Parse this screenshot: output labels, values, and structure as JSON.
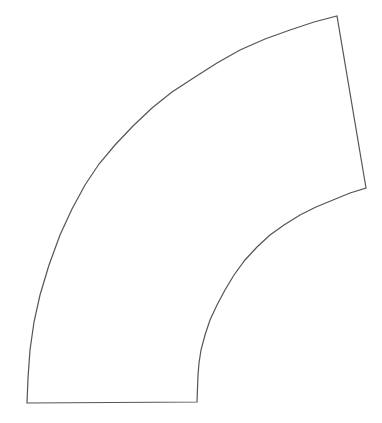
{
  "diagram": {
    "shape": "annular-sector",
    "stroke_color": "#555555",
    "fill_color": "#ffffff",
    "background": "#ffffff",
    "outer_arc": [
      [
        27,
        403
      ],
      [
        28,
        378
      ],
      [
        30,
        350
      ],
      [
        34,
        322
      ],
      [
        40,
        295
      ],
      [
        49,
        265
      ],
      [
        60,
        235
      ],
      [
        72,
        209
      ],
      [
        85,
        185
      ],
      [
        99,
        164
      ],
      [
        115,
        145
      ],
      [
        133,
        126
      ],
      [
        152,
        108
      ],
      [
        172,
        92
      ],
      [
        195,
        77
      ],
      [
        217,
        63
      ],
      [
        240,
        50
      ],
      [
        265,
        39
      ],
      [
        290,
        30
      ],
      [
        314,
        22
      ],
      [
        337,
        16
      ]
    ],
    "right_edge": [
      [
        337,
        16
      ],
      [
        366,
        188
      ]
    ],
    "inner_arc": [
      [
        366,
        188
      ],
      [
        350,
        193
      ],
      [
        333,
        200
      ],
      [
        316,
        207
      ],
      [
        300,
        215
      ],
      [
        284,
        225
      ],
      [
        270,
        235
      ],
      [
        257,
        247
      ],
      [
        245,
        260
      ],
      [
        234,
        275
      ],
      [
        225,
        290
      ],
      [
        217,
        305
      ],
      [
        210,
        320
      ],
      [
        205,
        335
      ],
      [
        201,
        350
      ],
      [
        199,
        363
      ],
      [
        198,
        375
      ],
      [
        197,
        402
      ]
    ],
    "bottom_edge": [
      [
        197,
        402
      ],
      [
        27,
        403
      ]
    ]
  }
}
